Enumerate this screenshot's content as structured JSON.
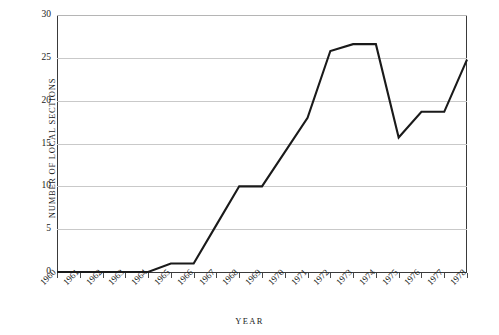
{
  "chart_data": {
    "type": "line",
    "title": "",
    "xlabel": "YEAR",
    "ylabel": "NUMBER OF LOCAL SECTIONS",
    "categories": [
      "1960",
      "1961",
      "1962",
      "1963",
      "1964",
      "1965",
      "1966",
      "1967",
      "1968",
      "1969",
      "1970",
      "1971",
      "1972",
      "1973",
      "1974",
      "1975",
      "1976",
      "1977",
      "1978"
    ],
    "x": [
      1960,
      1961,
      1962,
      1963,
      1964,
      1965,
      1966,
      1967,
      1968,
      1969,
      1970,
      1971,
      1972,
      1973,
      1974,
      1975,
      1976,
      1977,
      1978
    ],
    "values": [
      0,
      0,
      0,
      0,
      0,
      1,
      1,
      5.5,
      10,
      10,
      14,
      18,
      25.8,
      26.6,
      26.6,
      15.7,
      18.7,
      18.7,
      24.8
    ],
    "series": [
      {
        "name": "Number of local sections",
        "values": [
          0,
          0,
          0,
          0,
          0,
          1,
          1,
          5.5,
          10,
          10,
          14,
          18,
          25.8,
          26.6,
          26.6,
          15.7,
          18.7,
          18.7,
          24.8
        ]
      }
    ],
    "ylim": [
      0,
      30
    ],
    "yticks": [
      0,
      5,
      10,
      15,
      20,
      25,
      30
    ],
    "ytick_labels": [
      "0",
      "5",
      "10",
      "15",
      "20",
      "25",
      "30"
    ],
    "xlim": [
      1960,
      1978
    ],
    "grid": "horizontal",
    "legend": "none",
    "line_color": "#1a1a1a",
    "grid_color": "#c9c9c9",
    "axis_color": "#3a3a3a",
    "background": "#ffffff"
  }
}
